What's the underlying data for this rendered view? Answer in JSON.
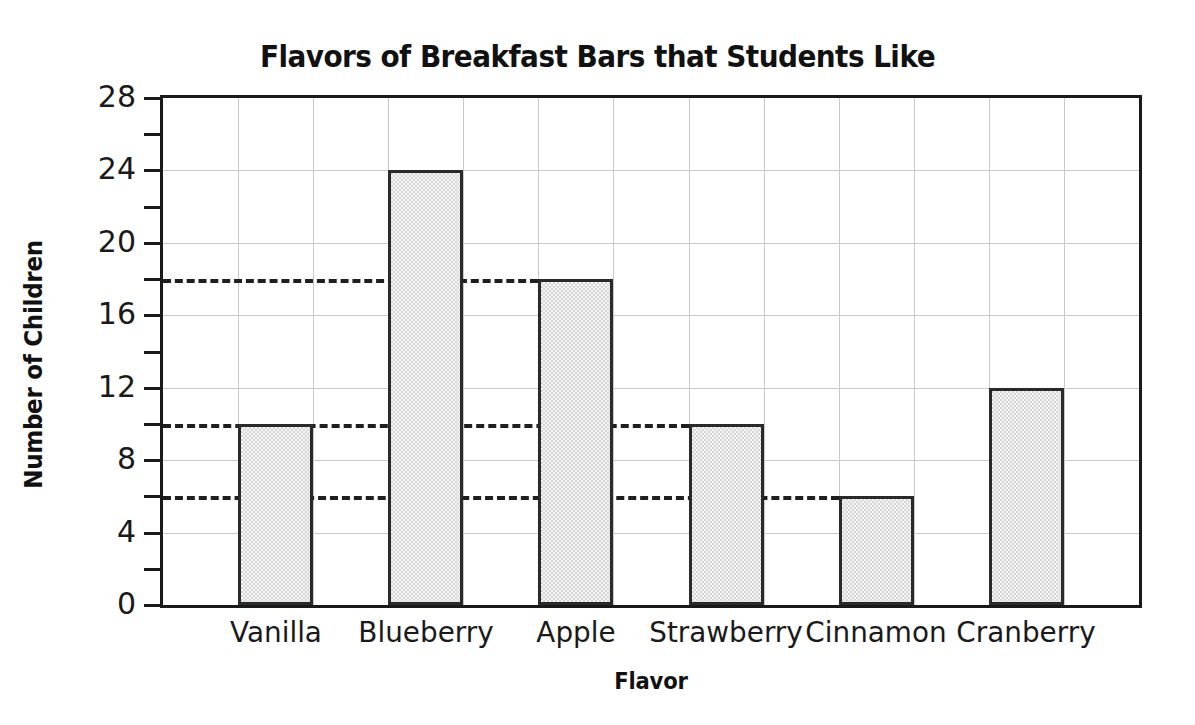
{
  "chart_data": {
    "type": "bar",
    "title": "Flavors of Breakfast Bars that Students Like",
    "xlabel": "Flavor",
    "ylabel": "Number of Children",
    "categories": [
      "Vanilla",
      "Blueberry",
      "Apple",
      "Strawberry",
      "Cinnamon",
      "Cranberry"
    ],
    "values": [
      10,
      24,
      18,
      10,
      6,
      12
    ],
    "ylim": [
      0,
      28
    ],
    "ytick_labels": [
      "0",
      "4",
      "8",
      "12",
      "16",
      "20",
      "24",
      "28"
    ],
    "ytick_values": [
      0,
      4,
      8,
      12,
      16,
      20,
      24,
      28
    ],
    "yminor_tick_values": [
      2,
      6,
      10,
      14,
      18,
      22,
      26
    ],
    "grid": true,
    "legend": "none",
    "annotations": [
      {
        "label": "dashed reference line at 18",
        "value": 18
      },
      {
        "label": "dashed reference line at 10",
        "value": 10
      },
      {
        "label": "dashed reference line at 6",
        "value": 6
      }
    ],
    "colors": {
      "bar_fill": "#d6d6d6",
      "bar_border": "#2a2a2a",
      "axis": "#1a1a1a",
      "gridline": "#c9c9c9",
      "dashed_line": "#1f1f1f",
      "background": "#ffffff",
      "text": "#111111"
    }
  }
}
